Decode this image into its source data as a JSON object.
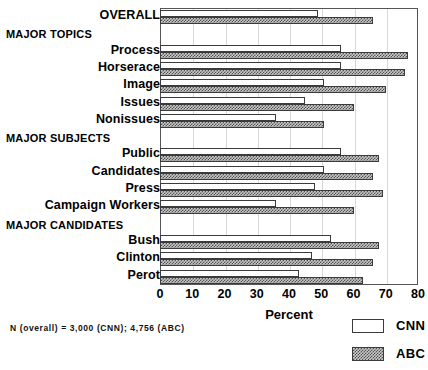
{
  "chart_data": {
    "type": "bar",
    "orientation": "horizontal",
    "title": "",
    "xlabel": "Percent",
    "ylabel": "",
    "xlim": [
      0,
      80
    ],
    "xticks": [
      0,
      10,
      20,
      30,
      40,
      50,
      60,
      70,
      80
    ],
    "grid": true,
    "legend_position": "bottom-right",
    "legend": [
      "CNN",
      "ABC"
    ],
    "series": [
      {
        "name": "CNN",
        "values": [
          49,
          null,
          56,
          56,
          51,
          45,
          36,
          null,
          56,
          51,
          48,
          36,
          null,
          53,
          47,
          43
        ]
      },
      {
        "name": "ABC",
        "values": [
          66,
          null,
          77,
          76,
          70,
          60,
          51,
          null,
          68,
          66,
          69,
          60,
          null,
          68,
          66,
          63
        ]
      }
    ],
    "categories": [
      "OVERALL",
      "MAJOR TOPICS",
      "Process",
      "Horserace",
      "Image",
      "Issues",
      "Nonissues",
      "MAJOR SUBJECTS",
      "Public",
      "Candidates",
      "Press",
      "Campaign Workers",
      "MAJOR CANDIDATES",
      "Bush",
      "Clinton",
      "Perot"
    ],
    "rows": [
      {
        "label": "OVERALL",
        "type": "item",
        "cnn": 49,
        "abc": 66
      },
      {
        "label": "MAJOR TOPICS",
        "type": "group",
        "cnn": null,
        "abc": null
      },
      {
        "label": "Process",
        "type": "item",
        "cnn": 56,
        "abc": 77
      },
      {
        "label": "Horserace",
        "type": "item",
        "cnn": 56,
        "abc": 76
      },
      {
        "label": "Image",
        "type": "item",
        "cnn": 51,
        "abc": 70
      },
      {
        "label": "Issues",
        "type": "item",
        "cnn": 45,
        "abc": 60
      },
      {
        "label": "Nonissues",
        "type": "item",
        "cnn": 36,
        "abc": 51
      },
      {
        "label": "MAJOR SUBJECTS",
        "type": "group",
        "cnn": null,
        "abc": null
      },
      {
        "label": "Public",
        "type": "item",
        "cnn": 56,
        "abc": 68
      },
      {
        "label": "Candidates",
        "type": "item",
        "cnn": 51,
        "abc": 66
      },
      {
        "label": "Press",
        "type": "item",
        "cnn": 48,
        "abc": 69
      },
      {
        "label": "Campaign Workers",
        "type": "item",
        "cnn": 36,
        "abc": 60
      },
      {
        "label": "MAJOR CANDIDATES",
        "type": "group",
        "cnn": null,
        "abc": null
      },
      {
        "label": "Bush",
        "type": "item",
        "cnn": 53,
        "abc": 68
      },
      {
        "label": "Clinton",
        "type": "item",
        "cnn": 47,
        "abc": 66
      },
      {
        "label": "Perot",
        "type": "item",
        "cnn": 43,
        "abc": 63
      }
    ],
    "annotations": [
      "N (overall) = 3,000 (CNN); 4,756 (ABC)"
    ]
  },
  "axis": {
    "xlabel": "Percent",
    "ticks": [
      "0",
      "10",
      "20",
      "30",
      "40",
      "50",
      "60",
      "70",
      "80"
    ]
  },
  "legend": {
    "items": [
      {
        "label": "CNN",
        "swatch": "white-outline"
      },
      {
        "label": "ABC",
        "swatch": "hatched-gray"
      }
    ]
  },
  "footnote": {
    "text": "N (overall) = 3,000 (CNN); 4,756 (ABC)"
  },
  "colors": {
    "cnn_fill": "#ffffff",
    "abc_fill": "#c9c9c9",
    "bar_stroke": "#3b3b3b",
    "frame": "#555555",
    "gridline": "#d8d8d8",
    "text": "#000000"
  }
}
